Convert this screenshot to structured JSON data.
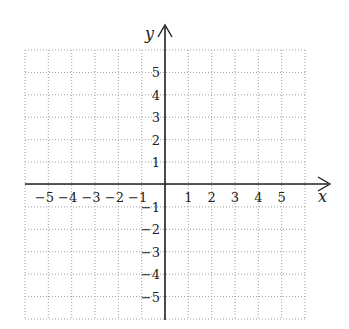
{
  "chart_data": {
    "type": "scatter",
    "title": "",
    "xlabel": "x",
    "ylabel": "y",
    "xlim": [
      -6,
      6
    ],
    "ylim": [
      -6,
      6
    ],
    "grid": true,
    "grid_style": "dotted",
    "x_ticks": [
      -5,
      -4,
      -3,
      -2,
      -1,
      1,
      2,
      3,
      4,
      5
    ],
    "y_ticks": [
      5,
      4,
      3,
      2,
      1,
      -1,
      -2,
      -3,
      -4,
      -5
    ],
    "x_tick_labels": [
      "−5",
      "−4",
      "−3",
      "−2",
      "−1",
      "1",
      "2",
      "3",
      "4",
      "5"
    ],
    "y_tick_labels": [
      "5",
      "4",
      "3",
      "2",
      "1",
      "−1",
      "−2",
      "−3",
      "−4",
      "−5"
    ],
    "series": [],
    "legend": null
  },
  "axes": {
    "x_label": "x",
    "y_label": "y",
    "axis_color": "#222222",
    "grid_color": "#a0a0a0"
  }
}
